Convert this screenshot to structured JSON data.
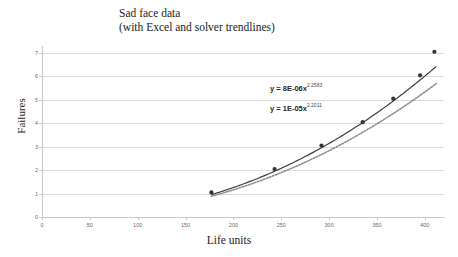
{
  "chart_data": {
    "type": "scatter",
    "title": "Sad face data",
    "subtitle": "(with Excel and solver trendlines)",
    "xlabel": "Life units",
    "ylabel": "Failures",
    "xlim": [
      0,
      420
    ],
    "ylim": [
      0,
      7.3
    ],
    "grid": true,
    "legend_position": "none",
    "xticks": [
      0,
      50,
      100,
      150,
      200,
      250,
      300,
      350,
      400
    ],
    "yticks": [
      0,
      1,
      2,
      3,
      4,
      5,
      6,
      7
    ],
    "points": [
      {
        "x": 177,
        "y": 1.05
      },
      {
        "x": 243,
        "y": 2.05
      },
      {
        "x": 292,
        "y": 3.05
      },
      {
        "x": 335,
        "y": 4.05
      },
      {
        "x": 367,
        "y": 5.05
      },
      {
        "x": 395,
        "y": 6.05
      },
      {
        "x": 410,
        "y": 7.05
      }
    ],
    "series": [
      {
        "name": "Excel trendline",
        "style": "solid",
        "color": "#3f3f3f",
        "equation_coefficient": 8e-06,
        "equation_exponent": 2.2583,
        "x_start": 177,
        "x_end": 412
      },
      {
        "name": "Solver trendline",
        "style": "dotted",
        "color": "#8d8d8d",
        "equation_coefficient": 1e-05,
        "equation_exponent": 2.2011,
        "x_start": 177,
        "x_end": 412
      }
    ],
    "annotations": [
      {
        "name": "excel-equation",
        "prefix": "y = 8E-06x",
        "exponent": "2.2583"
      },
      {
        "name": "solver-equation",
        "prefix": "y = 1E-05x",
        "exponent": "2.2011"
      }
    ],
    "colors": {
      "gridline": "#dcdcdc",
      "axis": "#c9c9c9",
      "tick_label": "#6b6b6b",
      "text": "#1c1c1c",
      "marker": "#333333",
      "background": "#ffffff"
    }
  }
}
